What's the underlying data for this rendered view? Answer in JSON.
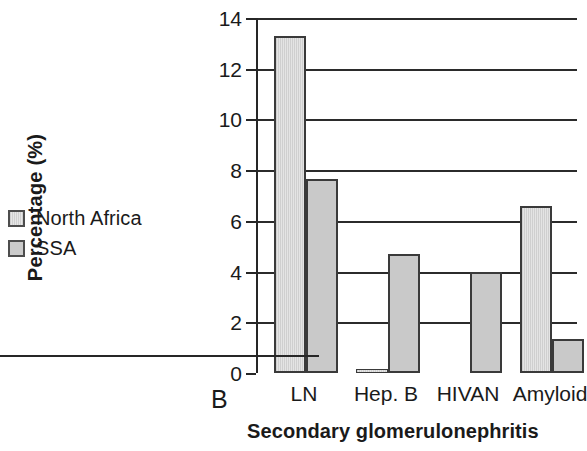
{
  "panel": {
    "label": "B"
  },
  "legend": {
    "position": "left-outside",
    "items": [
      {
        "label": "North Africa",
        "swatch": "legend-swatch-north-africa"
      },
      {
        "label": "SSA",
        "swatch": "legend-swatch-ssa"
      }
    ]
  },
  "chart_data": {
    "type": "bar",
    "title": "",
    "xlabel": "Secondary glomerulonephritis",
    "ylabel": "Percentage (%)",
    "categories": [
      "LN",
      "Hep. B",
      "HIVAN",
      "Amyloid"
    ],
    "series": [
      {
        "name": "North Africa",
        "values": [
          13.3,
          0.1,
          0,
          6.6
        ]
      },
      {
        "name": "SSA",
        "values": [
          7.65,
          4.7,
          4.0,
          1.35
        ]
      }
    ],
    "ylim": [
      0,
      14
    ],
    "yticks": [
      0,
      2,
      4,
      6,
      8,
      10,
      12,
      14
    ],
    "ytick_labels": [
      "0",
      "2",
      "4",
      "6",
      "8",
      "10",
      "12",
      "14"
    ],
    "grid": true,
    "note": "Right edge of figure is cropped; the Amyloid SSA bar and the 'Amyloid' tick label are clipped by the image border."
  },
  "colors": {
    "north_africa_fill": "#dcdcdc",
    "ssa_fill": "#c9c9c9",
    "bar_outline": "#3a3a3a",
    "axis": "#262626",
    "grid": "#2b2b2b",
    "text": "#1a1a1a",
    "background": "#ffffff"
  }
}
